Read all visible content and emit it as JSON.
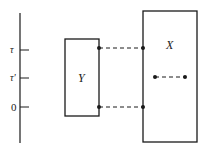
{
  "diagram": {
    "axis": {
      "ticks": [
        {
          "label": "τ",
          "y": 50
        },
        {
          "label": "τ'",
          "y": 78
        },
        {
          "label": "0",
          "y": 107
        }
      ]
    },
    "boxes": {
      "Y": {
        "label": "Y"
      },
      "X": {
        "label": "X"
      }
    },
    "colors": {
      "stroke": "#1a1a1a",
      "background": "#ffffff"
    }
  }
}
